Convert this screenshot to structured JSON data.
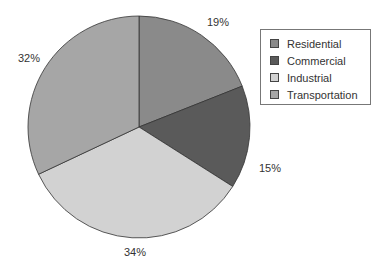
{
  "chart_data": {
    "type": "pie",
    "title": "",
    "categories": [
      "Residential",
      "Commercial",
      "Industrial",
      "Transportation"
    ],
    "values": [
      19,
      15,
      34,
      32
    ],
    "labels": [
      "19%",
      "15%",
      "34%",
      "32%"
    ],
    "colors": [
      "#8a8a8a",
      "#5a5a5a",
      "#d2d2d2",
      "#a6a6a6"
    ],
    "start_angle_deg": 0,
    "direction": "clockwise",
    "legend_position": "right"
  },
  "legend": {
    "items": [
      {
        "label": "Residential",
        "color": "#8a8a8a"
      },
      {
        "label": "Commercial",
        "color": "#5a5a5a"
      },
      {
        "label": "Industrial",
        "color": "#d2d2d2"
      },
      {
        "label": "Transportation",
        "color": "#a6a6a6"
      }
    ]
  }
}
